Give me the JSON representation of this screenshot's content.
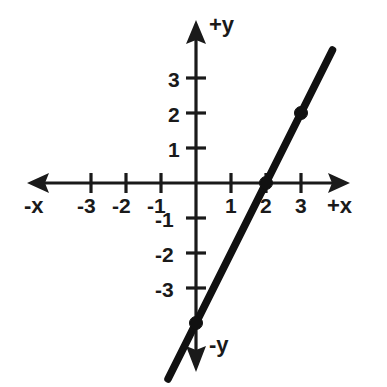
{
  "chart_data": {
    "type": "line",
    "title": "",
    "subtitle": "",
    "xlabel": "+x",
    "ylabel": "+y",
    "xlabel_negative": "-x",
    "ylabel_negative": "-y",
    "grid": false,
    "legend": "none",
    "xlim": [
      -4.8,
      4.4
    ],
    "ylim": [
      -5.3,
      4.6
    ],
    "x_ticks": [
      -3,
      -2,
      -1,
      1,
      2,
      3
    ],
    "y_ticks": [
      -3,
      -2,
      -1,
      1,
      2,
      3
    ],
    "x_tick_labels": [
      "-3",
      "-2",
      "-1",
      "1",
      "2",
      "3"
    ],
    "y_tick_labels": [
      "-3",
      "-2",
      "-1",
      "1",
      "2",
      "3"
    ],
    "series": [
      {
        "name": "line",
        "equation": "y = 2x - 4",
        "slope": 2,
        "y_intercept": -4,
        "x_intercept": 2,
        "x": [
          -0.8,
          3.9
        ],
        "y": [
          -5.6,
          3.8
        ],
        "marked_points": [
          {
            "x": 0,
            "y": -4
          },
          {
            "x": 2,
            "y": 0
          },
          {
            "x": 3,
            "y": 2
          }
        ]
      }
    ],
    "axis_arrows": [
      "left",
      "right",
      "up",
      "down"
    ],
    "origin_label": ""
  },
  "geometry": {
    "origin_x": 196,
    "origin_y": 183,
    "unit_px": 35,
    "x_axis_left": 27,
    "x_axis_right": 350,
    "y_axis_top": 20,
    "y_axis_bottom": 372,
    "tick_half_len": 10,
    "point_radius": 6.5
  },
  "colors": {
    "ink": "#1a1a1a",
    "line": "#111111",
    "background": "#ffffff"
  },
  "axis_labels": {
    "pos_y": "+y",
    "neg_y": "-y",
    "pos_x": "+x",
    "neg_x": "-x"
  },
  "tick_labels": {
    "x_neg3": "-3",
    "x_neg2": "-2",
    "x_neg1": "-1",
    "x_pos1": "1",
    "x_pos2": "2",
    "x_pos3": "3",
    "y_neg3": "-3",
    "y_neg2": "-2",
    "y_neg1": "-1",
    "y_pos1": "1",
    "y_pos2": "2",
    "y_pos3": "3"
  }
}
